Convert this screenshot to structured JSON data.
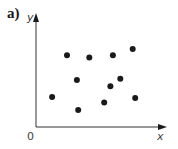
{
  "panel_label": "a)",
  "axes": {
    "x_label": "x",
    "y_label": "y",
    "origin_label": "0"
  },
  "colors": {
    "ink": "#1a1a1a",
    "axis": "#333333"
  },
  "chart_data": {
    "type": "scatter",
    "title": "",
    "xlabel": "x",
    "ylabel": "y",
    "grid": false,
    "legend": null,
    "xlim": [
      0,
      10
    ],
    "ylim": [
      0,
      10
    ],
    "points": [
      {
        "x": 1.3,
        "y": 2.8
      },
      {
        "x": 2.5,
        "y": 6.7
      },
      {
        "x": 3.3,
        "y": 4.4
      },
      {
        "x": 3.4,
        "y": 1.6
      },
      {
        "x": 4.3,
        "y": 6.5
      },
      {
        "x": 5.5,
        "y": 2.3
      },
      {
        "x": 6.0,
        "y": 3.8
      },
      {
        "x": 6.2,
        "y": 6.7
      },
      {
        "x": 6.8,
        "y": 4.5
      },
      {
        "x": 7.8,
        "y": 7.3
      },
      {
        "x": 8.0,
        "y": 2.7
      }
    ]
  }
}
